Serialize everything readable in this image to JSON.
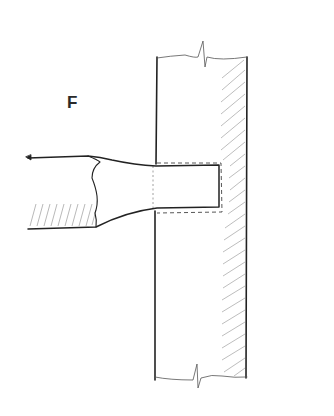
{
  "diagram": {
    "label": "F",
    "colors": {
      "ink": "#222222",
      "hatch": "#9a9a9a",
      "background": "#ffffff"
    }
  }
}
